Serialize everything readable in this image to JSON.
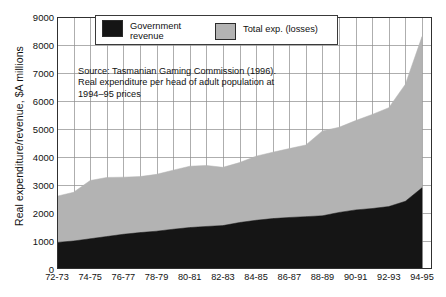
{
  "chart_data": {
    "type": "area",
    "title": "",
    "subtitle": "",
    "xlabel": "",
    "ylabel": "Real expenditure/revenue, $A millions",
    "ylim": [
      0,
      9000
    ],
    "ytick_values": [
      0,
      1000,
      2000,
      3000,
      4000,
      5000,
      6000,
      7000,
      8000,
      9000
    ],
    "ytick_labels": [
      "0",
      "1000",
      "2000",
      "3000",
      "4000",
      "5000",
      "6000",
      "7000",
      "8000",
      "9000"
    ],
    "grid": true,
    "grid_axes": "both",
    "legend_position": "top-center-inside",
    "stacked": true,
    "x": [
      "72-73",
      "73-74",
      "74-75",
      "75-76",
      "76-77",
      "77-78",
      "78-79",
      "79-80",
      "80-81",
      "81-82",
      "82-83",
      "83-84",
      "84-85",
      "85-86",
      "86-87",
      "87-88",
      "88-89",
      "89-90",
      "90-91",
      "91-92",
      "92-93",
      "93-94",
      "94-95"
    ],
    "xtick_labels": [
      "72-73",
      "74-75",
      "76-77",
      "78-79",
      "80-81",
      "82-83",
      "84-85",
      "86-87",
      "88-89",
      "90-91",
      "92-93",
      "94-95"
    ],
    "xtick_indices": [
      0,
      2,
      4,
      6,
      8,
      10,
      12,
      14,
      16,
      18,
      20,
      22
    ],
    "series": [
      {
        "name": "Government revenue",
        "color": "#151515",
        "values": [
          950,
          1000,
          1080,
          1160,
          1240,
          1300,
          1350,
          1420,
          1480,
          1520,
          1550,
          1660,
          1740,
          1800,
          1840,
          1870,
          1900,
          2020,
          2110,
          2160,
          2230,
          2420,
          2900
        ]
      },
      {
        "name": "Total exp. (losses)",
        "color": "#b3b3b3",
        "values": [
          2600,
          2740,
          3160,
          3270,
          3280,
          3300,
          3380,
          3530,
          3670,
          3700,
          3630,
          3800,
          4030,
          4170,
          4300,
          4430,
          4930,
          5060,
          5300,
          5520,
          5760,
          6600,
          8300
        ]
      }
    ],
    "annotations": [
      {
        "name": "source-note",
        "text": "Source: Tasmanian Gaming Commission (1996).\nReal expenditure per head of adult population at\n1994–95 prices"
      }
    ]
  },
  "legend": {
    "entries": [
      {
        "label": "Government\nrevenue",
        "swatch_color": "#151515"
      },
      {
        "label": "Total exp. (losses)",
        "swatch_color": "#b3b3b3"
      }
    ]
  },
  "axes": {
    "y_title": "Real expenditure/revenue, $A millions"
  },
  "colors": {
    "revenue_fill": "#151515",
    "total_fill": "#b3b3b3",
    "grid_line": "#8c8c8c",
    "axis_line": "#303030",
    "background": "#ffffff"
  }
}
